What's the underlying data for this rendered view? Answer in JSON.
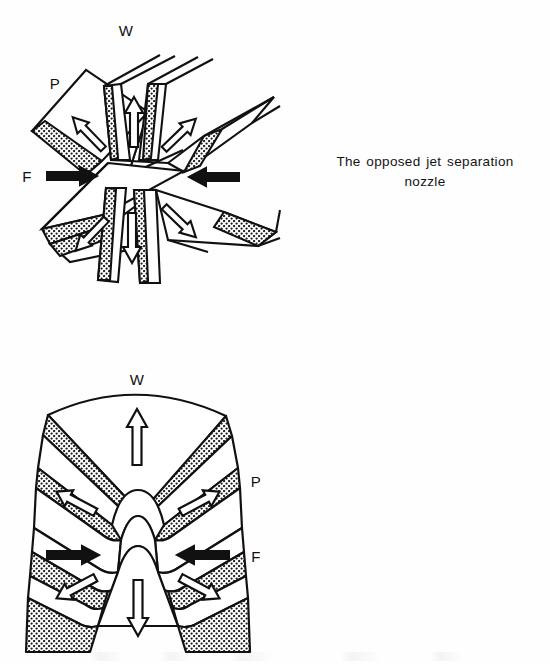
{
  "page": {
    "background_color": "#ffffff",
    "ink_color": "#111111",
    "width": 550,
    "height": 664
  },
  "figures": [
    {
      "id": "figure-1",
      "name": "opposed-jet-separation-nozzle",
      "caption_line_1": "The opposed jet separation",
      "caption_line_2": "nozzle",
      "labels": {
        "waste": "W",
        "product": "P",
        "feed": "F"
      },
      "flow_arrows": {
        "feed_style": "solid-black",
        "product_style": "hollow-outline",
        "waste_style": "hollow-outline"
      }
    },
    {
      "id": "figure-2",
      "name": "annular-separation-nozzle",
      "caption_line_1": "The annular separation",
      "caption_line_2": "nozzle",
      "labels": {
        "waste": "W",
        "product": "P",
        "feed": "F"
      },
      "flow_arrows": {
        "feed_style": "solid-black",
        "product_style": "hollow-outline",
        "waste_style": "hollow-outline"
      }
    }
  ]
}
